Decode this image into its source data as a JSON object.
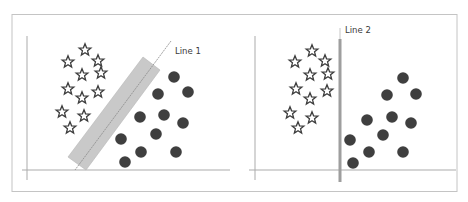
{
  "figure": {
    "colors": {
      "frame": "#bdbdbd",
      "axis": "#a8a8a8",
      "star_stroke": "#3d3d3d",
      "circle_fill": "#3f3f3f",
      "margin_band": "#c8c8c8",
      "line1": "#8f8f8f",
      "line2": "#9a9a9a"
    }
  },
  "panels": [
    {
      "id": "panel-1",
      "line_label": "Line 1",
      "separator": "diagonal line with wide margin band",
      "stars": [
        [
          85,
          50
        ],
        [
          68,
          62
        ],
        [
          98,
          61
        ],
        [
          82,
          75
        ],
        [
          101,
          73
        ],
        [
          68,
          89
        ],
        [
          98,
          92
        ],
        [
          82,
          98
        ],
        [
          62,
          112
        ],
        [
          84,
          116
        ],
        [
          70,
          128
        ]
      ],
      "circles": [
        [
          174,
          77
        ],
        [
          158,
          94
        ],
        [
          188,
          92
        ],
        [
          140,
          117
        ],
        [
          164,
          115
        ],
        [
          183,
          123
        ],
        [
          156,
          134
        ],
        [
          121,
          139
        ],
        [
          141,
          152
        ],
        [
          176,
          152
        ],
        [
          125,
          162
        ]
      ]
    },
    {
      "id": "panel-2",
      "line_label": "Line 2",
      "separator": "vertical line with narrow margin",
      "stars": [
        [
          312,
          51
        ],
        [
          295,
          62
        ],
        [
          325,
          61
        ],
        [
          310,
          75
        ],
        [
          328,
          74
        ],
        [
          296,
          89
        ],
        [
          327,
          91
        ],
        [
          310,
          99
        ],
        [
          290,
          113
        ],
        [
          312,
          118
        ],
        [
          298,
          128
        ]
      ],
      "circles": [
        [
          403,
          78
        ],
        [
          387,
          95
        ],
        [
          416,
          94
        ],
        [
          367,
          120
        ],
        [
          392,
          117
        ],
        [
          411,
          123
        ],
        [
          383,
          135
        ],
        [
          350,
          140
        ],
        [
          369,
          152
        ],
        [
          403,
          152
        ],
        [
          353,
          163
        ]
      ]
    }
  ]
}
